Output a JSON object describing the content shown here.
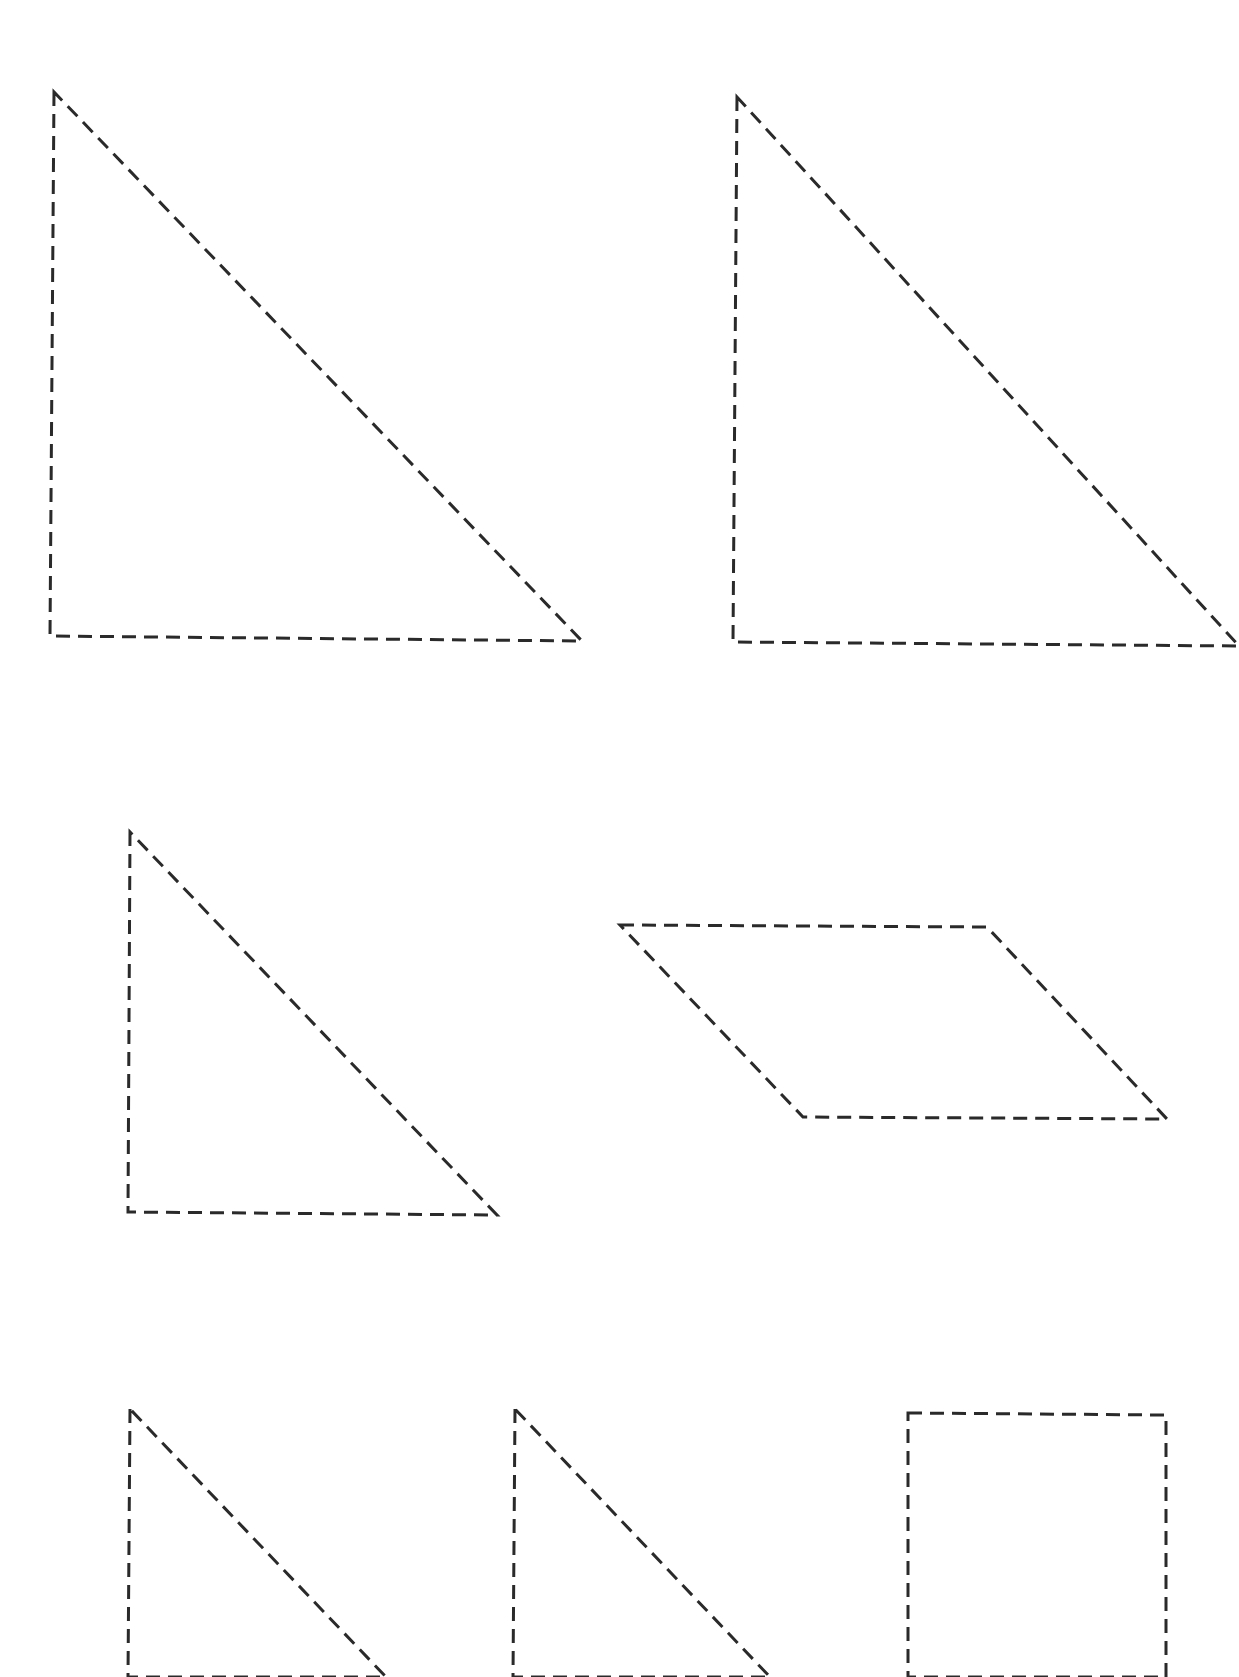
{
  "page": {
    "type": "tangram-cutout-worksheet",
    "background": "#ffffff",
    "stroke_color": "#2a2a2a"
  },
  "shapes": [
    {
      "name": "large-triangle-1",
      "kind": "triangle",
      "points": "54,92 50,636 582,641"
    },
    {
      "name": "large-triangle-2",
      "kind": "triangle",
      "points": "737,97 733,642 1239,646"
    },
    {
      "name": "medium-triangle",
      "kind": "triangle",
      "points": "130,832 128,1212 497,1215"
    },
    {
      "name": "parallelogram",
      "kind": "parallelogram",
      "points": "620,925 987,927 1167,1119 803,1117"
    },
    {
      "name": "small-triangle-1",
      "kind": "triangle",
      "points": "130,1409 128,1677 386,1677"
    },
    {
      "name": "small-triangle-2",
      "kind": "triangle",
      "points": "515,1409 513,1677 770,1677"
    },
    {
      "name": "square",
      "kind": "square",
      "points": "908,1413 1166,1415 1166,1677 908,1677"
    }
  ]
}
